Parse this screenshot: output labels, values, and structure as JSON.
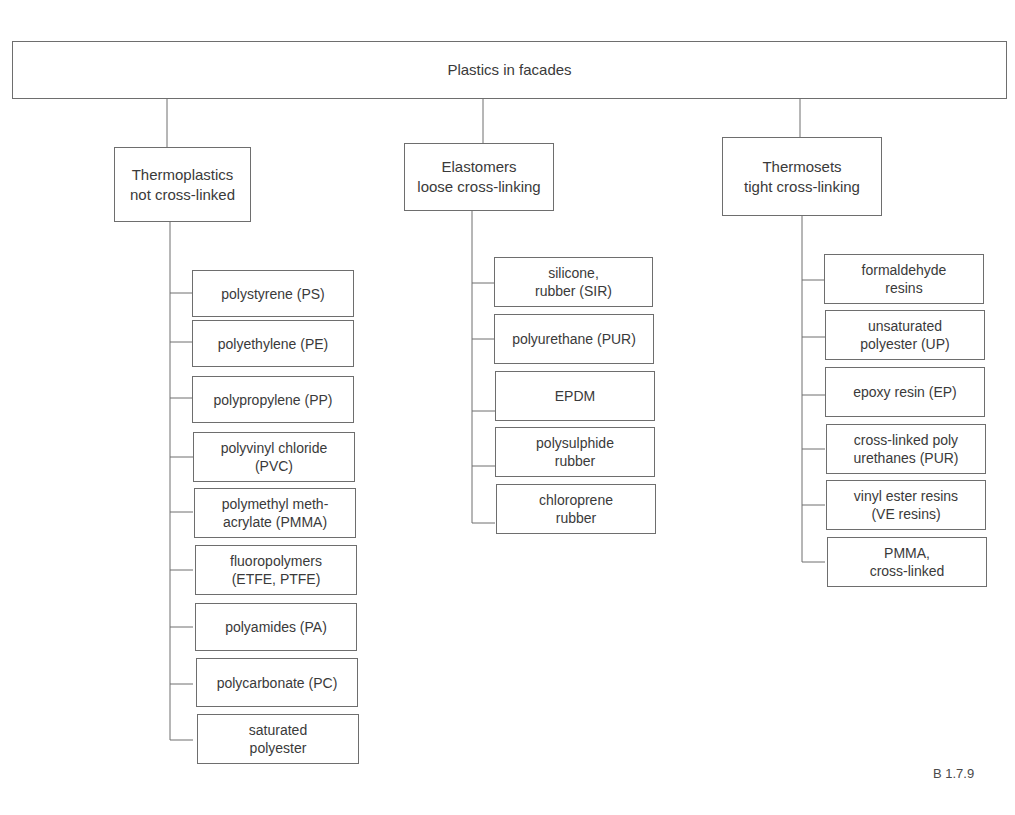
{
  "diagram": {
    "type": "tree",
    "root": "Plastics in facades",
    "categories": [
      {
        "label": "Thermoplastics\nnot cross-linked",
        "items": [
          "polystyrene (PS)",
          "polyethylene (PE)",
          "polypropylene (PP)",
          "polyvinyl chloride\n(PVC)",
          "polymethyl meth-\nacrylate (PMMA)",
          "fluoropolymers\n(ETFE, PTFE)",
          "polyamides (PA)",
          "polycarbonate (PC)",
          "saturated\npolyester"
        ]
      },
      {
        "label": "Elastomers\nloose cross-linking",
        "items": [
          "silicone,\nrubber (SIR)",
          "polyurethane (PUR)",
          "EPDM",
          "polysulphide\nrubber",
          "chloroprene\nrubber"
        ]
      },
      {
        "label": "Thermosets\ntight cross-linking",
        "items": [
          "formaldehyde\nresins",
          "unsaturated\npolyester (UP)",
          "epoxy resin (EP)",
          "cross-linked poly\nurethanes (PUR)",
          "vinyl ester resins\n(VE resins)",
          "PMMA,\ncross-linked"
        ]
      }
    ]
  },
  "figure_number": "B 1.7.9",
  "colors": {
    "line": "#6e6e6e",
    "text": "#3a3a3a",
    "background": "#ffffff"
  }
}
